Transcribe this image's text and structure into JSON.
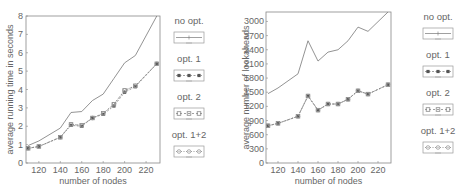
{
  "chart_data": [
    {
      "type": "line",
      "title": "",
      "xlabel": "number of nodes",
      "ylabel": "average running time in seconds",
      "x": [
        110,
        120,
        140,
        150,
        160,
        170,
        180,
        190,
        200,
        210,
        230
      ],
      "xticks": [
        120,
        140,
        160,
        180,
        200,
        220
      ],
      "yticks": [
        0,
        1,
        2,
        3,
        4,
        5,
        6,
        7,
        8
      ],
      "xlim": [
        108,
        233
      ],
      "ylim": [
        0,
        8
      ],
      "grid": false,
      "legend_position": "right",
      "series": [
        {
          "name": "no opt.",
          "marker": "none",
          "values": [
            0.95,
            1.2,
            1.9,
            2.75,
            2.8,
            3.4,
            3.75,
            4.6,
            5.45,
            5.85,
            8.0
          ]
        },
        {
          "name": "opt. 1",
          "marker": "asterisk",
          "values": [
            0.8,
            0.9,
            1.4,
            2.05,
            2.0,
            2.45,
            2.65,
            3.1,
            3.85,
            4.15,
            5.4
          ]
        },
        {
          "name": "opt. 2",
          "marker": "square",
          "values": [
            0.8,
            0.9,
            1.4,
            2.1,
            2.05,
            2.45,
            2.7,
            3.2,
            3.95,
            4.2,
            5.4
          ]
        },
        {
          "name": "opt. 1+2",
          "marker": "circle",
          "values": [
            0.8,
            0.9,
            1.4,
            2.1,
            2.05,
            2.45,
            2.7,
            3.2,
            3.95,
            4.2,
            5.4
          ]
        }
      ]
    },
    {
      "type": "line",
      "title": "",
      "xlabel": "number of nodes",
      "ylabel": "average number of lookaheads",
      "x": [
        110,
        120,
        140,
        150,
        160,
        170,
        180,
        190,
        200,
        210,
        230
      ],
      "xticks": [
        120,
        140,
        160,
        180,
        200,
        220
      ],
      "yticks": [
        0,
        300,
        600,
        900,
        1200,
        1500,
        1800,
        2100,
        2400,
        2700,
        3000
      ],
      "xlim": [
        108,
        233
      ],
      "ylim": [
        0,
        3200
      ],
      "grid": false,
      "legend_position": "right",
      "series": [
        {
          "name": "no opt.",
          "marker": "none",
          "values": [
            1470,
            1590,
            1890,
            2590,
            2160,
            2350,
            2400,
            2590,
            2880,
            2790,
            3200
          ]
        },
        {
          "name": "opt. 1",
          "marker": "asterisk",
          "values": [
            790,
            840,
            990,
            1420,
            1120,
            1250,
            1250,
            1350,
            1530,
            1460,
            1660
          ]
        },
        {
          "name": "opt. 2",
          "marker": "square",
          "values": [
            790,
            840,
            990,
            1420,
            1120,
            1250,
            1250,
            1350,
            1530,
            1460,
            1660
          ]
        },
        {
          "name": "opt. 1+2",
          "marker": "circle",
          "values": [
            790,
            840,
            990,
            1420,
            1120,
            1250,
            1250,
            1350,
            1530,
            1460,
            1660
          ]
        }
      ]
    }
  ],
  "legend": {
    "items": [
      {
        "label": "no opt."
      },
      {
        "label": "opt. 1"
      },
      {
        "label": "opt. 2"
      },
      {
        "label": "opt. 1+2"
      }
    ]
  },
  "colors": {
    "axis": "#888888",
    "line": "#777777",
    "text": "#666666"
  }
}
